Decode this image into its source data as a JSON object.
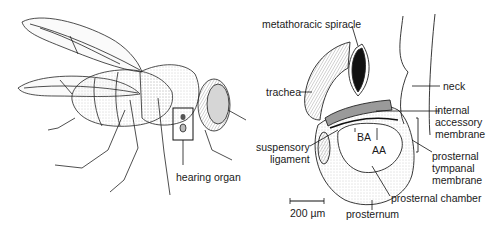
{
  "figure": {
    "left_panel": {
      "subject": "fly (lateral view)",
      "labels": {
        "hearing_organ": "hearing organ"
      }
    },
    "right_panel": {
      "subject": "hearing organ detail",
      "labels": {
        "metathoracic_spiracle": "metathoracic spiracle",
        "trachea": "trachea",
        "neck": "neck",
        "internal_accessory_membrane": [
          "internal",
          "accessory",
          "membrane"
        ],
        "suspensory_ligament": [
          "suspensory",
          "ligament"
        ],
        "ba": "BA",
        "aa": "AA",
        "prosternal_tympanal_membrane": [
          "prosternal",
          "tympanal",
          "membrane"
        ],
        "prosternal_chamber": "prosternal chamber",
        "prosternum": "prosternum"
      },
      "scale_bar": "200 µm"
    },
    "colors": {
      "line": "#1a1a1a",
      "stipple": "#cfcfcf",
      "shade": "#9a9a9a"
    }
  }
}
